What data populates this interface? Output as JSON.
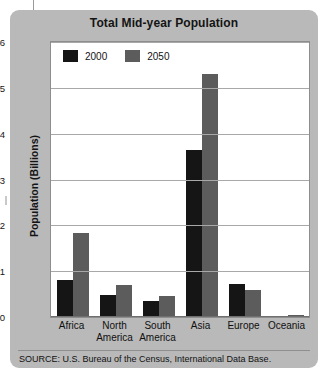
{
  "figure": {
    "title": "Total Mid-year Population",
    "source": "SOURCE: U.S. Bureau of the Census, International Data Base.",
    "panel_color": "#b9b9b9",
    "plot_background": "#ffffff"
  },
  "legend": {
    "position": "top-left-inside-plot",
    "items": [
      {
        "label": "2000",
        "color": "#151515"
      },
      {
        "label": "2050",
        "color": "#5c5c5c"
      }
    ]
  },
  "chart_data": {
    "type": "bar",
    "title": "Total Mid-year Population",
    "xlabel": "",
    "ylabel": "Population (Billions)",
    "ylim": [
      0,
      6
    ],
    "yticks": [
      0,
      1,
      2,
      3,
      4,
      5,
      6
    ],
    "ytick_labels": [
      "0",
      "1",
      "2",
      "3",
      "4",
      "5",
      "6"
    ],
    "grid": true,
    "legend_position": "upper left",
    "categories": [
      "Africa",
      "North America",
      "South America",
      "Asia",
      "Europe",
      "Oceania"
    ],
    "category_lines": [
      [
        "Africa"
      ],
      [
        "North",
        "America"
      ],
      [
        "South",
        "America"
      ],
      [
        "Asia"
      ],
      [
        "Europe"
      ],
      [
        "Oceania"
      ]
    ],
    "series": [
      {
        "name": "2000",
        "color": "#151515",
        "values": [
          0.8,
          0.47,
          0.35,
          3.65,
          0.73,
          0.03
        ]
      },
      {
        "name": "2050",
        "color": "#5c5c5c",
        "values": [
          1.83,
          0.7,
          0.45,
          5.3,
          0.6,
          0.05
        ]
      }
    ],
    "annotations": [],
    "source": "SOURCE: U.S. Bureau of the Census, International Data Base."
  }
}
